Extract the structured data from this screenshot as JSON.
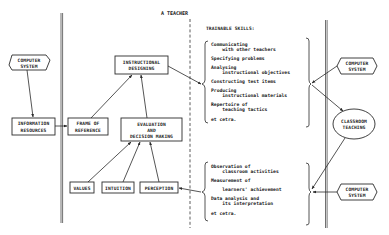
{
  "header": {
    "title": "A TEACHER",
    "skills_heading": "TRAINABLE SKILLS:"
  },
  "nodes": {
    "computer_system_left": "COMPUTER\nSYSTEM",
    "information_resources": [
      "INFORMATION",
      "RESOURCES"
    ],
    "frame_of_reference": [
      "FRAME OF",
      "REFERENCE"
    ],
    "instructional_designing": [
      "INSTRUCTIONAL",
      "DESIGNING"
    ],
    "evaluation": [
      "EVALUATION",
      "AND",
      "DECISION MAKING"
    ],
    "values": "VALUES",
    "intuition": "INTUITION",
    "perception": "PERCEPTION",
    "computer_system_top_right": [
      "COMPUTER",
      "SYSTEM"
    ],
    "classroom_teaching": [
      "CLASSROOM",
      "TEACHING"
    ],
    "computer_system_bottom_right": [
      "COMPUTER",
      "SYSTEM"
    ],
    "computer_system_left_lines": [
      "COMPUTER",
      "SYSTEM"
    ]
  },
  "skills_design": [
    [
      "Communicating",
      "  with other teachers"
    ],
    [
      "Specifying problems"
    ],
    [
      "Analysing",
      "  instructional objectives"
    ],
    [
      "Constructing test items"
    ],
    [
      "Producing",
      "  instructional materials"
    ],
    [
      "Repertoire of",
      "  teaching tactics"
    ],
    [
      "et cetra."
    ]
  ],
  "skills_evaluation": [
    [
      "Observation of",
      "  classroom activities"
    ],
    [
      "Measurement of"
    ],
    [
      "  learners' achievement"
    ],
    [
      "Data analysis and",
      "  its interpretation"
    ],
    [
      "et cetra."
    ]
  ],
  "colors": {
    "ink": "#2a2a2a",
    "background": "#ffffff"
  }
}
